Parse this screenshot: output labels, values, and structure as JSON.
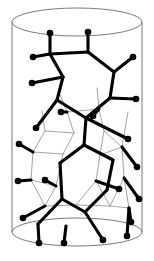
{
  "figure": {
    "canvas": {
      "width": 154,
      "height": 261
    },
    "background_color": "#ffffff"
  },
  "style": {
    "front_bond_color": "#000000",
    "front_bond_width": 3.1,
    "back_bond_color": "#9a9a9a",
    "back_bond_width": 0.9,
    "cylinder_outline_color": "#6b6b6b",
    "cylinder_outline_width": 0.9,
    "atom_fill_color": "#000000",
    "atom_radius": 3.3,
    "terminal_bond_width": 3.1
  },
  "cylinder": {
    "name": "transparent-cylinder",
    "center_x": 77,
    "radius_x": 65,
    "radius_y": 14,
    "top_y": 22,
    "bottom_y": 232,
    "left_wall_x": 12,
    "right_wall_x": 142
  },
  "chart_data": {
    "type": "diagram",
    "xlabel": "",
    "ylabel": "",
    "xlim": [
      0,
      154
    ],
    "ylim": [
      0,
      261
    ],
    "grid": false,
    "legend": "none",
    "front_vertices": [
      {
        "id": "f1",
        "x": 50,
        "y": 54
      },
      {
        "id": "f2",
        "x": 88,
        "y": 52
      },
      {
        "id": "f3",
        "x": 63,
        "y": 77
      },
      {
        "id": "f4",
        "x": 114,
        "y": 72
      },
      {
        "id": "f5",
        "x": 110,
        "y": 98
      },
      {
        "id": "f6",
        "x": 57,
        "y": 100
      },
      {
        "id": "f7",
        "x": 86,
        "y": 118
      },
      {
        "id": "f8",
        "x": 84,
        "y": 145
      },
      {
        "id": "f9",
        "x": 60,
        "y": 163
      },
      {
        "id": "f10",
        "x": 113,
        "y": 160
      },
      {
        "id": "f11",
        "x": 107,
        "y": 190
      },
      {
        "id": "f12",
        "x": 62,
        "y": 199
      },
      {
        "id": "f13",
        "x": 85,
        "y": 212
      },
      {
        "id": "f14",
        "x": 38,
        "y": 224
      },
      {
        "id": "f15",
        "x": 66,
        "y": 226
      }
    ],
    "front_bonds": [
      [
        "f1",
        "f2"
      ],
      [
        "f1",
        "f3"
      ],
      [
        "f2",
        "f4"
      ],
      [
        "f3",
        "f6"
      ],
      [
        "f4",
        "f5"
      ],
      [
        "f5",
        "f7"
      ],
      [
        "f6",
        "f7"
      ],
      [
        "f7",
        "f8"
      ],
      [
        "f8",
        "f9"
      ],
      [
        "f8",
        "f10"
      ],
      [
        "f9",
        "f12"
      ],
      [
        "f10",
        "f11"
      ],
      [
        "f11",
        "f13"
      ],
      [
        "f12",
        "f13"
      ],
      [
        "f12",
        "f14"
      ]
    ],
    "back_vertices": [
      {
        "id": "b1",
        "x": 67,
        "y": 112
      },
      {
        "id": "b2",
        "x": 99,
        "y": 109
      },
      {
        "id": "b3",
        "x": 45,
        "y": 131
      },
      {
        "id": "b4",
        "x": 74,
        "y": 133
      },
      {
        "id": "b5",
        "x": 104,
        "y": 131
      },
      {
        "id": "b6",
        "x": 33,
        "y": 152
      },
      {
        "id": "b7",
        "x": 63,
        "y": 154
      },
      {
        "id": "b8",
        "x": 100,
        "y": 155
      },
      {
        "id": "b9",
        "x": 122,
        "y": 147
      },
      {
        "id": "b10",
        "x": 31,
        "y": 180
      },
      {
        "id": "b11",
        "x": 56,
        "y": 186
      },
      {
        "id": "b12",
        "x": 96,
        "y": 181
      },
      {
        "id": "b13",
        "x": 124,
        "y": 178
      },
      {
        "id": "b14",
        "x": 45,
        "y": 206
      },
      {
        "id": "b15",
        "x": 76,
        "y": 205
      },
      {
        "id": "b16",
        "x": 110,
        "y": 206
      },
      {
        "id": "b17",
        "x": 129,
        "y": 208
      },
      {
        "id": "b18",
        "x": 59,
        "y": 92
      },
      {
        "id": "b19",
        "x": 97,
        "y": 88
      },
      {
        "id": "b20",
        "x": 42,
        "y": 111
      },
      {
        "id": "b21",
        "x": 128,
        "y": 112
      }
    ],
    "back_bonds": [
      [
        "b18",
        "b1"
      ],
      [
        "b19",
        "b2"
      ],
      [
        "b1",
        "b2"
      ],
      [
        "b1",
        "b4"
      ],
      [
        "b20",
        "b3"
      ],
      [
        "b2",
        "b5"
      ],
      [
        "b3",
        "b4"
      ],
      [
        "b4",
        "b7"
      ],
      [
        "b5",
        "b8"
      ],
      [
        "b21",
        "b9"
      ],
      [
        "b5",
        "b9"
      ],
      [
        "b3",
        "b6"
      ],
      [
        "b6",
        "b7"
      ],
      [
        "b7",
        "b11"
      ],
      [
        "b8",
        "b12"
      ],
      [
        "b9",
        "b13"
      ],
      [
        "b6",
        "b10"
      ],
      [
        "b10",
        "b11"
      ],
      [
        "b11",
        "b14"
      ],
      [
        "b12",
        "b15"
      ],
      [
        "b13",
        "b16"
      ],
      [
        "b13",
        "b17"
      ],
      [
        "b14",
        "b15"
      ],
      [
        "b15",
        "b16"
      ],
      [
        "b16",
        "b17"
      ],
      [
        "b10",
        "b14"
      ],
      [
        "b8",
        "b9"
      ],
      [
        "b12",
        "b16"
      ]
    ],
    "terminal_atoms": [
      {
        "id": "a1",
        "x": 50,
        "y": 33,
        "attached_to": "f1",
        "layer": "front"
      },
      {
        "id": "a2",
        "x": 88,
        "y": 32,
        "attached_to": "f2",
        "layer": "front"
      },
      {
        "id": "a3",
        "x": 33,
        "y": 57,
        "attached_to": "f1",
        "layer": "front"
      },
      {
        "id": "a4",
        "x": 133,
        "y": 57,
        "attached_to": "f4",
        "layer": "front"
      },
      {
        "id": "a5",
        "x": 32,
        "y": 83,
        "attached_to": "f3",
        "layer": "front"
      },
      {
        "id": "a6",
        "x": 136,
        "y": 99,
        "attached_to": "f5",
        "layer": "front"
      },
      {
        "id": "a7",
        "x": 36,
        "y": 128,
        "attached_to": "f6",
        "layer": "front"
      },
      {
        "id": "a8",
        "x": 128,
        "y": 139,
        "attached_to": "f7",
        "layer": "front"
      },
      {
        "id": "a9",
        "x": 61,
        "y": 112,
        "attached_to": "b1",
        "layer": "front"
      },
      {
        "id": "a10",
        "x": 93,
        "y": 116,
        "attached_to": "b2",
        "layer": "front"
      },
      {
        "id": "a11",
        "x": 19,
        "y": 144,
        "attached_to": "b6",
        "layer": "back"
      },
      {
        "id": "a12",
        "x": 137,
        "y": 167,
        "attached_to": "b9",
        "layer": "back"
      },
      {
        "id": "a13",
        "x": 18,
        "y": 181,
        "attached_to": "b10",
        "layer": "back"
      },
      {
        "id": "a14",
        "x": 45,
        "y": 180,
        "attached_to": "b11",
        "layer": "back"
      },
      {
        "id": "a15",
        "x": 119,
        "y": 189,
        "attached_to": "b12",
        "layer": "back"
      },
      {
        "id": "a16",
        "x": 139,
        "y": 199,
        "attached_to": "b13",
        "layer": "back"
      },
      {
        "id": "a17",
        "x": 23,
        "y": 218,
        "attached_to": "b14",
        "layer": "back"
      },
      {
        "id": "a18",
        "x": 131,
        "y": 222,
        "attached_to": "b17",
        "layer": "back"
      },
      {
        "id": "a19",
        "x": 39,
        "y": 243,
        "attached_to": "f14",
        "layer": "front"
      },
      {
        "id": "a20",
        "x": 64,
        "y": 243,
        "attached_to": "f15",
        "layer": "front"
      },
      {
        "id": "a21",
        "x": 103,
        "y": 240,
        "attached_to": "f13",
        "layer": "front"
      },
      {
        "id": "a22",
        "x": 127,
        "y": 236,
        "attached_to": "b17",
        "layer": "back"
      }
    ],
    "counts": {
      "front_vertices": 15,
      "back_vertices": 21,
      "front_bonds": 15,
      "back_bonds": 28,
      "terminal_atoms": 22
    }
  }
}
